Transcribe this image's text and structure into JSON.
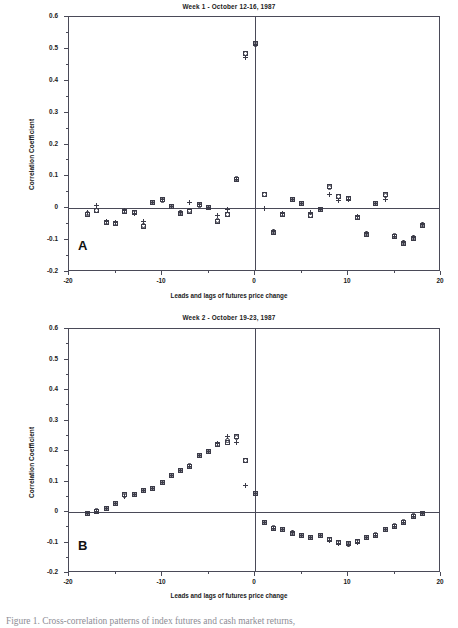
{
  "figure": {
    "caption": "Figure 1. Cross-correlation patterns of index futures and cash market returns,"
  },
  "axis": {
    "xlabel": "Leads and lags of futures price change",
    "ylabel": "Correlation Coefficient",
    "ylim": [
      -0.2,
      0.6
    ],
    "xlim": [
      -20,
      20
    ],
    "yticks": [
      "0.6",
      "0.5",
      "0.4",
      "0.3",
      "0.2",
      "0.1",
      "0",
      "-0.1",
      "-0.2"
    ],
    "ytick_values": [
      0.6,
      0.5,
      0.4,
      0.3,
      0.2,
      0.1,
      0,
      -0.1,
      -0.2
    ],
    "xticks": [
      "-20",
      "-10",
      "0",
      "10",
      "20"
    ],
    "xtick_values": [
      -20,
      -10,
      0,
      10,
      20
    ],
    "xminor_values": [
      -15,
      -5,
      5,
      15
    ],
    "grid": false
  },
  "panels": [
    {
      "id": "A",
      "letter": "A",
      "title": "Week 1 - October 12-16, 1987"
    },
    {
      "id": "B",
      "letter": "B",
      "title": "Week 2 - October 19-23, 1987"
    }
  ],
  "chart_data": [
    {
      "type": "scatter",
      "title": "Week 1 - October 12-16, 1987",
      "panel": "A",
      "xlabel": "Leads and lags of futures price change",
      "ylabel": "Correlation Coefficient",
      "xlim": [
        -20,
        20
      ],
      "ylim": [
        -0.2,
        0.6
      ],
      "grid": false,
      "legend": "none",
      "x": [
        -18,
        -17,
        -16,
        -15,
        -14,
        -13,
        -12,
        -11,
        -10,
        -9,
        -8,
        -7,
        -6,
        -5,
        -4,
        -3,
        -2,
        -1,
        0,
        1,
        2,
        3,
        4,
        5,
        6,
        7,
        8,
        9,
        10,
        11,
        12,
        13,
        14,
        15,
        16,
        17,
        18
      ],
      "series": [
        {
          "name": "square",
          "marker": "square",
          "values": [
            -0.021,
            -0.007,
            -0.046,
            -0.049,
            -0.01,
            -0.014,
            -0.057,
            0.018,
            0.026,
            0.004,
            -0.015,
            -0.009,
            0.011,
            0.001,
            -0.04,
            -0.02,
            0.091,
            0.485,
            0.516,
            0.043,
            -0.076,
            -0.021,
            0.028,
            0.016,
            -0.023,
            -0.005,
            0.067,
            0.038,
            0.031,
            -0.03,
            -0.081,
            0.016,
            0.043,
            -0.089,
            -0.11,
            -0.094,
            -0.053
          ]
        },
        {
          "name": "circle",
          "marker": "circle",
          "values": [
            -0.015,
            -0.006,
            -0.044,
            -0.048,
            -0.009,
            -0.013,
            -0.055,
            0.018,
            0.025,
            0.004,
            -0.014,
            -0.008,
            0.01,
            0.002,
            -0.038,
            -0.019,
            0.092,
            0.487,
            0.515,
            0.042,
            -0.074,
            -0.02,
            0.029,
            0.015,
            -0.022,
            -0.004,
            0.066,
            0.036,
            0.03,
            -0.029,
            -0.079,
            0.015,
            0.041,
            -0.086,
            -0.108,
            -0.093,
            -0.052
          ]
        },
        {
          "name": "plus",
          "marker": "plus",
          "values": [
            -0.012,
            0.008,
            -0.042,
            -0.046,
            -0.008,
            -0.017,
            -0.043,
            0.019,
            0.027,
            0.005,
            -0.013,
            0.018,
            0.012,
            0.003,
            -0.023,
            -0.004,
            0.09,
            0.472,
            0.514,
            0.0,
            -0.073,
            -0.018,
            0.029,
            0.016,
            -0.014,
            -0.004,
            0.042,
            0.023,
            0.029,
            -0.027,
            -0.078,
            0.014,
            0.027,
            -0.088,
            -0.106,
            -0.092,
            -0.051
          ]
        }
      ]
    },
    {
      "type": "scatter",
      "title": "Week 2 - October 19-23, 1987",
      "panel": "B",
      "xlabel": "Leads and lags of futures price change",
      "ylabel": "Correlation Coefficient",
      "xlim": [
        -20,
        20
      ],
      "ylim": [
        -0.2,
        0.6
      ],
      "grid": false,
      "legend": "none",
      "x": [
        -18,
        -17,
        -16,
        -15,
        -14,
        -13,
        -12,
        -11,
        -10,
        -9,
        -8,
        -7,
        -6,
        -5,
        -4,
        -3,
        -2,
        -1,
        0,
        1,
        2,
        3,
        4,
        5,
        6,
        7,
        8,
        9,
        10,
        11,
        12,
        13,
        14,
        15,
        16,
        17,
        18
      ],
      "series": [
        {
          "name": "square",
          "marker": "square",
          "values": [
            -0.005,
            0.003,
            0.01,
            0.028,
            0.057,
            0.058,
            0.071,
            0.077,
            0.097,
            0.119,
            0.135,
            0.15,
            0.185,
            0.198,
            0.22,
            0.229,
            0.246,
            0.168,
            0.06,
            -0.034,
            -0.053,
            -0.057,
            -0.069,
            -0.077,
            -0.084,
            -0.077,
            -0.091,
            -0.101,
            -0.103,
            -0.097,
            -0.083,
            -0.076,
            -0.057,
            -0.046,
            -0.033,
            -0.014,
            -0.005
          ]
        },
        {
          "name": "circle",
          "marker": "circle",
          "values": [
            -0.004,
            0.004,
            0.011,
            0.029,
            0.055,
            0.058,
            0.072,
            0.078,
            0.098,
            0.121,
            0.136,
            0.151,
            0.186,
            0.199,
            0.221,
            0.233,
            0.244,
            0.169,
            0.061,
            -0.033,
            -0.052,
            -0.056,
            -0.068,
            -0.076,
            -0.083,
            -0.076,
            -0.09,
            -0.1,
            -0.105,
            -0.096,
            -0.082,
            -0.075,
            -0.056,
            -0.045,
            -0.032,
            -0.013,
            -0.004
          ]
        },
        {
          "name": "plus",
          "marker": "plus",
          "values": [
            -0.005,
            0.003,
            0.011,
            0.028,
            0.051,
            0.059,
            0.072,
            0.077,
            0.097,
            0.12,
            0.135,
            0.15,
            0.185,
            0.199,
            0.224,
            0.248,
            0.229,
            0.088,
            0.06,
            -0.034,
            -0.054,
            -0.057,
            -0.068,
            -0.077,
            -0.083,
            -0.078,
            -0.092,
            -0.104,
            -0.106,
            -0.099,
            -0.084,
            -0.077,
            -0.057,
            -0.046,
            -0.033,
            -0.014,
            -0.005
          ]
        }
      ]
    }
  ]
}
